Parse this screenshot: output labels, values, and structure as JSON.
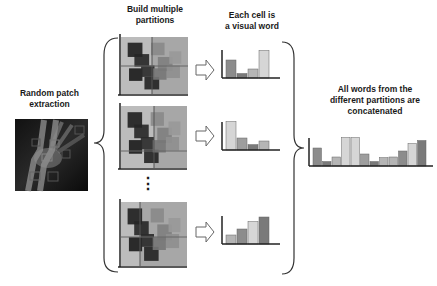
{
  "labels": {
    "random_patch": [
      "Random patch",
      "extraction"
    ],
    "build_partitions": [
      "Build multiple",
      "partitions"
    ],
    "each_cell": [
      "Each cell is",
      "a visual word"
    ],
    "concatenated": [
      "All words from the",
      "different partitions are",
      "concatenated"
    ]
  },
  "ellipsis": "⋮",
  "colors": {
    "bar_shades": [
      "#8c8c8c",
      "#9e9e9e",
      "#b5b5b5",
      "#d6d6d6",
      "#7a7a7a"
    ],
    "axis": "#222222",
    "partition_bg": "#bcbcbc",
    "partition_right_bg": "#9a9a9a"
  },
  "histograms": [
    {
      "name": "partition-1",
      "values": [
        0.6,
        0.15,
        0.3,
        0.92
      ],
      "shades": [
        0,
        4,
        2,
        3
      ]
    },
    {
      "name": "partition-2",
      "values": [
        0.95,
        0.4,
        0.18,
        0.3
      ],
      "shades": [
        3,
        1,
        4,
        2
      ]
    },
    {
      "name": "partition-3",
      "values": [
        0.3,
        0.5,
        0.75,
        0.9
      ],
      "shades": [
        2,
        0,
        3,
        4
      ]
    }
  ],
  "concatenated_histogram": {
    "values": [
      0.6,
      0.15,
      0.3,
      0.95,
      0.95,
      0.4,
      0.15,
      0.28,
      0.3,
      0.5,
      0.75,
      0.85
    ],
    "shades": [
      0,
      4,
      2,
      3,
      3,
      1,
      4,
      2,
      2,
      0,
      3,
      4
    ]
  }
}
